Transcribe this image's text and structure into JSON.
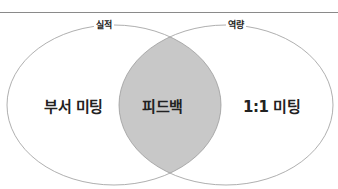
{
  "diagram": {
    "type": "venn",
    "sets": [
      {
        "id": "left",
        "label": "실적",
        "region_label": "부서 미팅"
      },
      {
        "id": "right",
        "label": "역량",
        "region_label": "1:1 미팅"
      }
    ],
    "intersection": {
      "label": "피드백",
      "fill": "#c8c8c8"
    },
    "colors": {
      "stroke": "#9a9a9a",
      "background": "#ffffff",
      "text": "#222222"
    }
  }
}
